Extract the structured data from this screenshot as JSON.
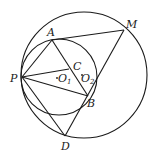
{
  "diagram": {
    "type": "geometry",
    "circles": [
      {
        "name": "outer-circle",
        "center": "O2",
        "cx": 84,
        "cy": 75,
        "r": 63
      },
      {
        "name": "inner-circle",
        "center": "O1",
        "cx": 59,
        "cy": 77,
        "r": 38
      }
    ],
    "points": {
      "P": {
        "x": 22,
        "y": 77
      },
      "A": {
        "x": 52,
        "y": 40
      },
      "M": {
        "x": 124,
        "y": 30
      },
      "B": {
        "x": 88,
        "y": 96
      },
      "D": {
        "x": 65,
        "y": 136
      },
      "C": {
        "x": 69,
        "y": 69
      },
      "O1": {
        "x": 57,
        "y": 78
      },
      "O2": {
        "x": 82,
        "y": 75
      }
    },
    "segments": [
      [
        "P",
        "A"
      ],
      [
        "A",
        "M"
      ],
      [
        "M",
        "D"
      ],
      [
        "P",
        "D"
      ],
      [
        "A",
        "B"
      ],
      [
        "P",
        "C"
      ],
      [
        "P",
        "B"
      ]
    ],
    "labels": {
      "A": {
        "text": "A",
        "x": 47,
        "y": 36
      },
      "M": {
        "text": "M",
        "x": 126,
        "y": 28
      },
      "P": {
        "text": "P",
        "x": 10,
        "y": 82
      },
      "C": {
        "text": "C",
        "x": 73,
        "y": 70
      },
      "O1": {
        "text": "O",
        "sub": "1",
        "x": 58,
        "y": 82
      },
      "O2": {
        "text": "O",
        "sub": "2",
        "x": 81,
        "y": 82
      },
      "B": {
        "text": "B",
        "x": 87,
        "y": 107
      },
      "D": {
        "text": "D",
        "x": 61,
        "y": 150
      }
    }
  }
}
